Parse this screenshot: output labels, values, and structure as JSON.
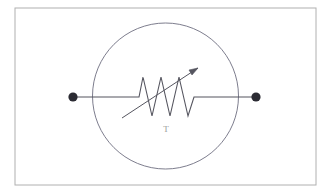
{
  "figure": {
    "background_color": "#ffffff",
    "border": {
      "name": "outer-frame",
      "x": 15,
      "y": 8,
      "width": 301,
      "height": 177,
      "stroke_color": "#b0b0b0",
      "stroke_width": 1,
      "fill": "none"
    },
    "enclosure_circle": {
      "name": "component-enclosure",
      "cx": 165.5,
      "cy": 96,
      "r": 73,
      "stroke_color": "#6e6e80",
      "stroke_width": 0.9,
      "fill": "none"
    },
    "terminals": [
      {
        "name": "left-terminal-node",
        "cx": 73,
        "cy": 97,
        "r": 4.6,
        "color": "#2b2b33"
      },
      {
        "name": "right-terminal-node",
        "cx": 256,
        "cy": 97,
        "r": 4.6,
        "color": "#2b2b33"
      }
    ],
    "lead_wires": [
      {
        "name": "left-lead-wire",
        "x1": 73,
        "y1": 97,
        "x2": 133,
        "y2": 97,
        "color": "#55555f",
        "width": 1.1
      },
      {
        "name": "right-lead-wire",
        "x1": 200,
        "y1": 97,
        "x2": 256,
        "y2": 97,
        "color": "#55555f",
        "width": 1.1
      }
    ],
    "resistor_zigzag": {
      "name": "resistor-zigzag",
      "points": "133,97 139,97 143,77 152,116 161,77 170,116 179,77 188,116 194,97 200,97",
      "color": "#55555f",
      "width": 1.1
    },
    "arrow": {
      "name": "adjustment-arrow",
      "x1": 122,
      "y1": 118,
      "x2": 198,
      "y2": 68,
      "color": "#55555f",
      "width": 1.0,
      "head_points": "198,68 189,70 192,75"
    },
    "label": {
      "name": "resistor-label",
      "text": "T",
      "x": 166,
      "y": 132,
      "color": "#9a9a9a"
    }
  }
}
